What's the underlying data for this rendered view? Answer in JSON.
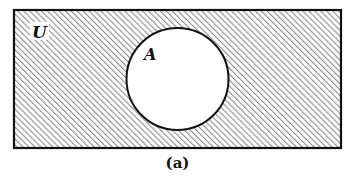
{
  "diagram": {
    "type": "venn",
    "caption": "(a)",
    "universe": {
      "label": "U",
      "shaded": true,
      "rect": {
        "x": 14,
        "y": 10,
        "width": 327,
        "height": 138
      }
    },
    "sets": [
      {
        "label": "A",
        "shaded": false,
        "circle": {
          "cx": 177.5,
          "cy": 79,
          "r": 51
        }
      }
    ],
    "shaded_region": "U \\ A (complement of A)",
    "colors": {
      "outline": "#111111",
      "hatch": "#8a8a8a",
      "background": "#ffffff"
    }
  }
}
